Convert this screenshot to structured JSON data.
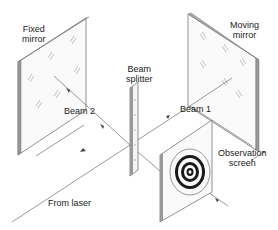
{
  "diagram": {
    "labels": {
      "fixed_mirror_1": "Fixed",
      "fixed_mirror_2": "mirror",
      "moving_mirror_1": "Moving",
      "moving_mirror_2": "mirror",
      "beam_splitter_1": "Beam",
      "beam_splitter_2": "splitter",
      "beam_1": "Beam 1",
      "beam_2": "Beam 2",
      "observation_screen_1": "Observation",
      "observation_screen_2": "screen",
      "from_laser": "From laser"
    },
    "colors": {
      "line": "#555555",
      "edge": "#888888",
      "plate_fill": "#fafafa",
      "fringe_dark": "#1a1a1a"
    }
  }
}
